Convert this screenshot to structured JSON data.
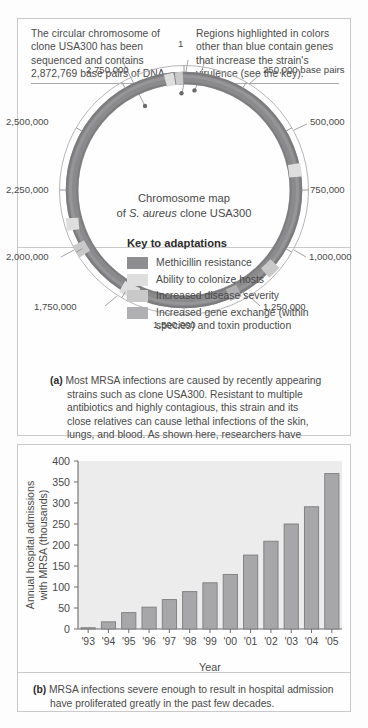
{
  "figure": {
    "panel_a": {
      "callout_left": "The circular chromosome of clone USA300 has been sequenced and contains 2,872,769 base pairs of DNA.",
      "callout_right": "Regions highlighted in colors other than blue contain genes that increase the strain's virulence (see the key).",
      "map_title_line1": "Chromosome map",
      "map_title_line2_pre": "of ",
      "map_title_line2_italic": "S. aureus",
      "map_title_line2_post": " clone USA300",
      "key_title": "Key to adaptations",
      "key_items": [
        {
          "label": "Methicillin resistance",
          "color": "#8e8e90"
        },
        {
          "label": "Ability to colonize hosts",
          "color": "#dededf"
        },
        {
          "label": "Increased disease severity",
          "color": "#c9c9ca"
        },
        {
          "label": "Increased gene exchange (within species) and toxin production",
          "color": "#b0b0b2"
        }
      ],
      "tick_labels": [
        "1",
        "250,000 base pairs",
        "500,000",
        "750,000",
        "1,000,000",
        "1,250,000",
        "1,500,000",
        "1,750,000",
        "2,000,000",
        "2,250,000",
        "2,500,000",
        "2,750,000"
      ],
      "caption_tag": "(a)",
      "caption_text": "Most MRSA infections are caused by recently appearing strains such as clone USA300. Resistant to multiple antibiotics and highly contagious, this strain and its close relatives can cause lethal infections of the skin, lungs, and blood. As shown here, researchers have identified key areas of the USA300 genome that code for adaptations that cause its virulent properties."
    },
    "panel_b": {
      "caption_tag": "(b)",
      "caption_text": "MRSA infections severe enough to result in hospital admission have proliferated greatly in the past few decades."
    }
  },
  "chart_data": {
    "type": "bar",
    "title": "",
    "xlabel": "Year",
    "ylabel": "Annual hospital admissions with MRSA (thousands)",
    "categories": [
      "'93",
      "'94",
      "'95",
      "'96",
      "'97",
      "'98",
      "'99",
      "'00",
      "'01",
      "'02",
      "'03",
      "'04",
      "'05"
    ],
    "values": [
      3,
      17,
      39,
      52,
      70,
      89,
      110,
      130,
      176,
      209,
      250,
      291,
      370
    ],
    "ylim": [
      0,
      400
    ],
    "yticks": [
      0,
      50,
      100,
      150,
      200,
      250,
      300,
      350,
      400
    ],
    "ytick_labels": [
      "0",
      "50",
      "100",
      "150",
      "200",
      "250",
      "300",
      "350",
      "400"
    ],
    "grid": false,
    "legend": "none",
    "bar_color": "#a7a7a9",
    "bar_edge_color": "#7c7c7e",
    "plot_bg": "#ececec"
  },
  "colors": {
    "frame": "#c9c9cb",
    "ring_main": "#8a8a8c",
    "page_bg": "#fdfdfd",
    "text": "#4a4a4a"
  }
}
